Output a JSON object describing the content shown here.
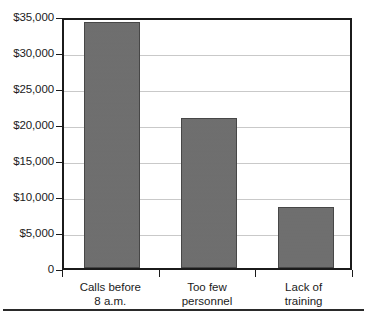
{
  "chart_data": {
    "type": "bar",
    "title": "",
    "subtitle": "",
    "xlabel": "",
    "ylabel": "",
    "categories": [
      "Calls before\n8 a.m.",
      "Too few\npersonnel",
      "Lack of\ntraining"
    ],
    "values": [
      34100,
      20800,
      8500
    ],
    "ylim": [
      0,
      35000
    ],
    "yticks": [
      0,
      5000,
      10000,
      15000,
      20000,
      25000,
      30000,
      35000
    ],
    "ytick_labels": [
      "0",
      "$5,000",
      "$10,000",
      "$15,000",
      "$20,000",
      "$25,000",
      "$30,000",
      "$35,000"
    ],
    "grid": true,
    "legend": false,
    "legend_position": "none",
    "bar_color": "#6e6e6e",
    "bar_edge_color": "#474747",
    "gridline_color": "#c9c9c9",
    "axis_color": "#1b1b1b"
  }
}
